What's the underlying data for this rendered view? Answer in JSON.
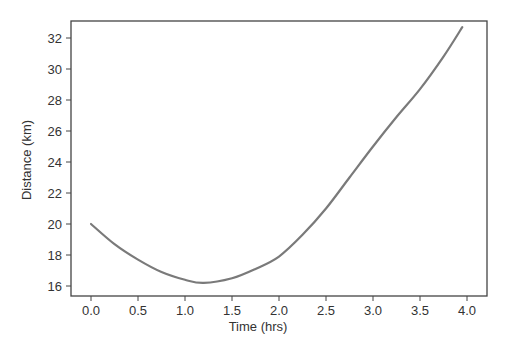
{
  "chart_data": {
    "type": "line",
    "title": "",
    "xlabel": "Time (hrs)",
    "ylabel": "Distance (km)",
    "xlim": [
      -0.2,
      4.2
    ],
    "ylim": [
      15.3,
      33.2
    ],
    "xticks": [
      0.0,
      0.5,
      1.0,
      1.5,
      2.0,
      2.5,
      3.0,
      3.5,
      4.0
    ],
    "xtick_labels": [
      "0.0",
      "0.5",
      "1.0",
      "1.5",
      "2.0",
      "2.5",
      "3.0",
      "3.5",
      "4.0"
    ],
    "yticks": [
      16,
      18,
      20,
      22,
      24,
      26,
      28,
      30,
      32
    ],
    "ytick_labels": [
      "16",
      "18",
      "20",
      "22",
      "24",
      "26",
      "28",
      "30",
      "32"
    ],
    "grid": false,
    "legend": null,
    "series": [
      {
        "name": "distance",
        "color": "#7a7a7a",
        "x": [
          0.0,
          0.25,
          0.5,
          0.75,
          1.0,
          1.2,
          1.5,
          1.75,
          2.0,
          2.25,
          2.5,
          2.75,
          3.0,
          3.25,
          3.5,
          3.75,
          3.95
        ],
        "y": [
          20.0,
          18.7,
          17.7,
          16.9,
          16.4,
          16.2,
          16.5,
          17.1,
          17.9,
          19.3,
          21.0,
          23.0,
          25.0,
          26.9,
          28.7,
          30.8,
          32.7
        ]
      }
    ]
  },
  "colors": {
    "frame": "#444444",
    "line": "#7a7a7a",
    "text": "#333333",
    "background": "#ffffff"
  }
}
